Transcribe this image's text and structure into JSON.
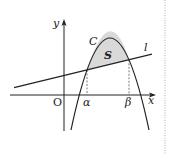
{
  "diagram": {
    "type": "function-graph",
    "labels": {
      "y_axis": "y",
      "x_axis": "x",
      "origin": "O",
      "curve": "C",
      "line": "l",
      "region": "S",
      "alpha": "α",
      "beta": "β"
    },
    "colors": {
      "stroke": "#222222",
      "region_fill": "#d9d9d9",
      "dotted_border": "#999999"
    }
  }
}
